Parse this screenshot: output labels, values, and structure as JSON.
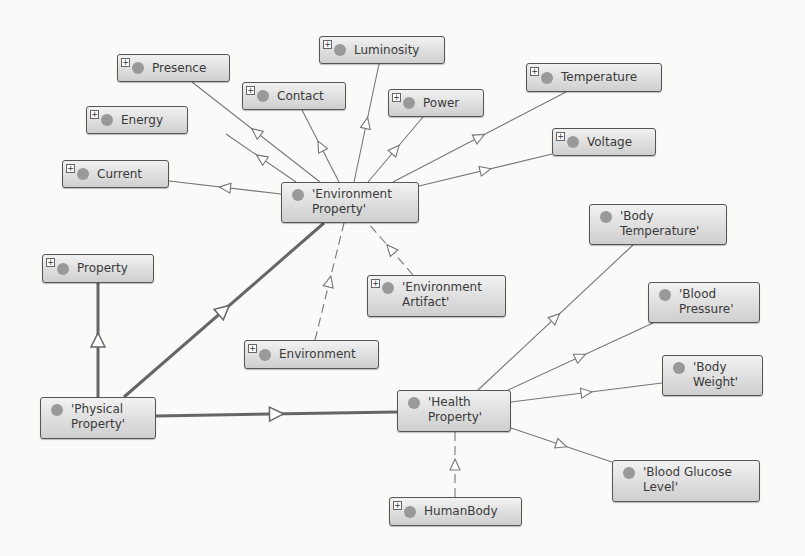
{
  "diagram": {
    "type": "ontology class graph",
    "nodes": [
      {
        "id": "luminosity",
        "label": "Luminosity",
        "expandable": true,
        "x": 319,
        "y": 36,
        "w": 126,
        "h": 28
      },
      {
        "id": "presence",
        "label": "Presence",
        "expandable": true,
        "x": 117,
        "y": 54,
        "w": 113,
        "h": 28
      },
      {
        "id": "contact",
        "label": "Contact",
        "expandable": true,
        "x": 242,
        "y": 82,
        "w": 104,
        "h": 28
      },
      {
        "id": "power",
        "label": "Power",
        "expandable": true,
        "x": 388,
        "y": 89,
        "w": 96,
        "h": 28
      },
      {
        "id": "temperature",
        "label": "Temperature",
        "expandable": true,
        "x": 526,
        "y": 63,
        "w": 136,
        "h": 29
      },
      {
        "id": "energy",
        "label": "Energy",
        "expandable": true,
        "x": 86,
        "y": 106,
        "w": 102,
        "h": 28
      },
      {
        "id": "voltage",
        "label": "Voltage",
        "expandable": true,
        "x": 552,
        "y": 128,
        "w": 104,
        "h": 28
      },
      {
        "id": "current",
        "label": "Current",
        "expandable": true,
        "x": 62,
        "y": 160,
        "w": 107,
        "h": 28
      },
      {
        "id": "env_property",
        "label": "'Environment\nProperty'",
        "expandable": false,
        "x": 281,
        "y": 182,
        "w": 138,
        "h": 41
      },
      {
        "id": "body_temperature",
        "label": "'Body\nTemperature'",
        "expandable": false,
        "x": 589,
        "y": 204,
        "w": 138,
        "h": 41
      },
      {
        "id": "property",
        "label": "Property",
        "expandable": true,
        "x": 42,
        "y": 254,
        "w": 112,
        "h": 29
      },
      {
        "id": "env_artifact",
        "label": "'Environment\nArtifact'",
        "expandable": true,
        "x": 367,
        "y": 275,
        "w": 139,
        "h": 42
      },
      {
        "id": "blood_pressure",
        "label": "'Blood\nPressure'",
        "expandable": false,
        "x": 648,
        "y": 282,
        "w": 112,
        "h": 41
      },
      {
        "id": "environment",
        "label": "Environment",
        "expandable": true,
        "x": 244,
        "y": 340,
        "w": 135,
        "h": 29
      },
      {
        "id": "body_weight",
        "label": "'Body\nWeight'",
        "expandable": false,
        "x": 662,
        "y": 355,
        "w": 101,
        "h": 41
      },
      {
        "id": "health_property",
        "label": "'Health\nProperty'",
        "expandable": false,
        "x": 397,
        "y": 390,
        "w": 114,
        "h": 42
      },
      {
        "id": "physical_property",
        "label": "'Physical\nProperty'",
        "expandable": false,
        "x": 40,
        "y": 397,
        "w": 116,
        "h": 42
      },
      {
        "id": "blood_glucose",
        "label": "'Blood Glucose\nLevel'",
        "expandable": false,
        "x": 612,
        "y": 460,
        "w": 148,
        "h": 42
      },
      {
        "id": "humanbody",
        "label": "HumanBody",
        "expandable": true,
        "x": 389,
        "y": 497,
        "w": 133,
        "h": 29
      }
    ],
    "edges": [
      {
        "from": "env_property",
        "to": "presence",
        "style": "thin",
        "x1": 320,
        "y1": 182,
        "x2": 192,
        "y2": 82
      },
      {
        "from": "env_property",
        "to": "energy",
        "style": "thin",
        "x1": 296,
        "y1": 182,
        "x2": 226,
        "y2": 134
      },
      {
        "from": "env_property",
        "to": "current",
        "style": "thin",
        "x1": 281,
        "y1": 194,
        "x2": 169,
        "y2": 181
      },
      {
        "from": "env_property",
        "to": "contact",
        "style": "thin",
        "x1": 339,
        "y1": 182,
        "x2": 302,
        "y2": 110
      },
      {
        "from": "env_property",
        "to": "luminosity",
        "style": "thin",
        "x1": 354,
        "y1": 182,
        "x2": 379,
        "y2": 64
      },
      {
        "from": "env_property",
        "to": "power",
        "style": "thin",
        "x1": 368,
        "y1": 182,
        "x2": 423,
        "y2": 117
      },
      {
        "from": "env_property",
        "to": "temperature",
        "style": "thin",
        "x1": 393,
        "y1": 182,
        "x2": 566,
        "y2": 92
      },
      {
        "from": "env_property",
        "to": "voltage",
        "style": "thin",
        "x1": 419,
        "y1": 186,
        "x2": 552,
        "y2": 154
      },
      {
        "from": "env_artifact",
        "to": "env_property",
        "style": "dashed",
        "x1": 413,
        "y1": 275,
        "x2": 368,
        "y2": 223
      },
      {
        "from": "environment",
        "to": "env_property",
        "style": "dashed",
        "x1": 315,
        "y1": 340,
        "x2": 344,
        "y2": 223
      },
      {
        "from": "physical_property",
        "to": "env_property",
        "style": "thick",
        "x1": 124,
        "y1": 397,
        "x2": 324,
        "y2": 223
      },
      {
        "from": "physical_property",
        "to": "property",
        "style": "thick",
        "x1": 98,
        "y1": 397,
        "x2": 98,
        "y2": 283
      },
      {
        "from": "physical_property",
        "to": "health_property",
        "style": "thick",
        "x1": 156,
        "y1": 416,
        "x2": 397,
        "y2": 412
      },
      {
        "from": "health_property",
        "to": "body_temperature",
        "style": "thin",
        "x1": 478,
        "y1": 390,
        "x2": 633,
        "y2": 245
      },
      {
        "from": "health_property",
        "to": "blood_pressure",
        "style": "thin",
        "x1": 508,
        "y1": 390,
        "x2": 653,
        "y2": 323
      },
      {
        "from": "health_property",
        "to": "body_weight",
        "style": "thin",
        "x1": 511,
        "y1": 402,
        "x2": 662,
        "y2": 383
      },
      {
        "from": "health_property",
        "to": "blood_glucose",
        "style": "thin",
        "x1": 511,
        "y1": 428,
        "x2": 612,
        "y2": 462
      },
      {
        "from": "humanbody",
        "to": "health_property",
        "style": "dashed",
        "x1": 455,
        "y1": 497,
        "x2": 455,
        "y2": 432
      }
    ]
  },
  "colors": {
    "background": "#fafaf8",
    "node_border": "#555555",
    "node_dot": "#999999",
    "edge": "#777777",
    "thick_edge": "#666666"
  }
}
